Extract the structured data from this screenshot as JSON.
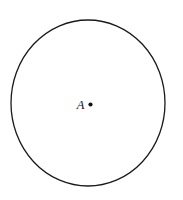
{
  "figure": {
    "kind": "geometry-diagram",
    "canvas": {
      "width": 183,
      "height": 200,
      "background_color": "#ffffff"
    },
    "circle": {
      "name": "circle",
      "center_x": 88,
      "center_y": 103,
      "radius_x": 77,
      "radius_y": 83,
      "stroke_color": "#1a1a1a",
      "stroke_width": 1.3,
      "fill": "none"
    },
    "center_point": {
      "name": "point-A",
      "x": 90.5,
      "y": 104.5,
      "dot_radius": 2.1,
      "color": "#111111"
    },
    "center_label": {
      "text": "A",
      "x": 80.5,
      "y": 108.5,
      "color": "#111111"
    }
  }
}
